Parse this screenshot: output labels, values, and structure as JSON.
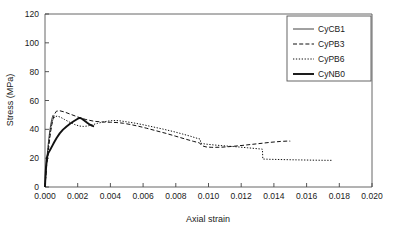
{
  "chart_data": {
    "type": "line",
    "title": "",
    "xlabel": "Axial strain",
    "ylabel": "Stress (MPa)",
    "xlim": [
      0.0,
      0.02
    ],
    "ylim": [
      0,
      120
    ],
    "xticks": [
      "0.000",
      "0.002",
      "0.004",
      "0.006",
      "0.008",
      "0.010",
      "0.012",
      "0.014",
      "0.016",
      "0.018",
      "0.020"
    ],
    "xtick_values": [
      0.0,
      0.002,
      0.004,
      0.006,
      0.008,
      0.01,
      0.012,
      0.014,
      0.016,
      0.018,
      0.02
    ],
    "yticks": [
      "0",
      "20",
      "40",
      "60",
      "80",
      "100",
      "120"
    ],
    "ytick_values": [
      0,
      20,
      40,
      60,
      80,
      100,
      120
    ],
    "grid": false,
    "legend_position": "top-right",
    "background": "#ffffff",
    "line_color": "#111111",
    "series": [
      {
        "name": "CyCB1",
        "style": "solid-thin",
        "stroke_width": 0.8,
        "dash": "none",
        "x": [
          0.0,
          4e-05,
          9e-05,
          0.00014,
          0.0002,
          0.00026,
          0.00032,
          0.00038,
          0.00044,
          0.0005
        ],
        "y": [
          0.0,
          7.0,
          15.0,
          23.0,
          30.0,
          36.0,
          41.0,
          45.0,
          48.0,
          50.0
        ]
      },
      {
        "name": "CyPB3",
        "style": "dashed",
        "stroke_width": 1.0,
        "dash": "4,2.2",
        "x": [
          0.0,
          0.0001,
          0.00022,
          0.00034,
          0.00046,
          0.00058,
          0.0007,
          0.0009,
          0.0012,
          0.0016,
          0.002,
          0.0025,
          0.003,
          0.0035,
          0.004,
          0.0044,
          0.0048,
          0.0052,
          0.0057,
          0.0062,
          0.0068,
          0.0074,
          0.008,
          0.0086,
          0.0091,
          0.00945,
          0.0096,
          0.00985,
          0.0102,
          0.0108,
          0.0115,
          0.0122,
          0.013,
          0.0138,
          0.0144,
          0.0149,
          0.015
        ],
        "y": [
          0.0,
          14.0,
          27.0,
          38.0,
          46.0,
          50.5,
          52.6,
          52.9,
          52.0,
          50.3,
          48.6,
          46.8,
          45.6,
          45.1,
          44.9,
          44.7,
          44.2,
          43.4,
          42.2,
          40.8,
          39.0,
          37.2,
          35.2,
          33.2,
          31.6,
          30.6,
          28.6,
          27.8,
          27.5,
          27.6,
          28.2,
          29.0,
          30.0,
          31.0,
          31.6,
          31.9,
          31.8
        ]
      },
      {
        "name": "CyPB6",
        "style": "dotted",
        "stroke_width": 1.0,
        "dash": "1.3,1.6",
        "x": [
          0.0,
          0.0001,
          0.00022,
          0.00034,
          0.00046,
          0.00058,
          0.00075,
          0.00095,
          0.0012,
          0.0015,
          0.0018,
          0.0021,
          0.00235,
          0.0026,
          0.0029,
          0.0032,
          0.00355,
          0.0039,
          0.0042,
          0.0044,
          0.00465,
          0.005,
          0.00545,
          0.006,
          0.0066,
          0.0072,
          0.0078,
          0.0084,
          0.0089,
          0.0093,
          0.0095,
          0.00952,
          0.0098,
          0.0103,
          0.0109,
          0.0116,
          0.0124,
          0.01305,
          0.01325,
          0.0133,
          0.01332,
          0.0138,
          0.0146,
          0.0155,
          0.0165,
          0.0173,
          0.0176
        ],
        "y": [
          0.0,
          16.0,
          30.0,
          40.0,
          46.0,
          48.6,
          49.2,
          48.4,
          46.8,
          45.0,
          43.4,
          42.3,
          42.0,
          42.3,
          43.2,
          44.1,
          45.1,
          45.8,
          46.1,
          46.1,
          45.8,
          45.2,
          44.4,
          43.2,
          41.7,
          40.2,
          38.6,
          36.8,
          35.2,
          33.8,
          33.2,
          30.4,
          29.8,
          29.2,
          28.6,
          28.0,
          27.2,
          26.5,
          26.3,
          26.2,
          19.4,
          19.2,
          19.0,
          18.8,
          18.6,
          18.5,
          18.5
        ]
      },
      {
        "name": "CyNB0",
        "style": "solid-thick",
        "stroke_width": 1.9,
        "dash": "none",
        "x": [
          0.0,
          2e-05,
          6e-05,
          0.00012,
          0.0002,
          0.0003,
          0.00042,
          0.00056,
          0.00072,
          0.0009,
          0.0011,
          0.00132,
          0.00155,
          0.00178,
          0.00198,
          0.00212,
          0.00225,
          0.0024,
          0.00258,
          0.00275,
          0.0029,
          0.003
        ],
        "y": [
          0.0,
          6.0,
          14.0,
          20.5,
          23.5,
          25.5,
          28.0,
          31.0,
          34.2,
          37.2,
          39.8,
          42.0,
          44.0,
          45.8,
          47.2,
          47.9,
          47.4,
          46.2,
          44.6,
          43.2,
          42.4,
          42.1
        ]
      }
    ]
  },
  "legend": {
    "entries": [
      {
        "label": "CyCB1"
      },
      {
        "label": "CyPB3"
      },
      {
        "label": "CyPB6"
      },
      {
        "label": "CyNB0"
      }
    ]
  }
}
